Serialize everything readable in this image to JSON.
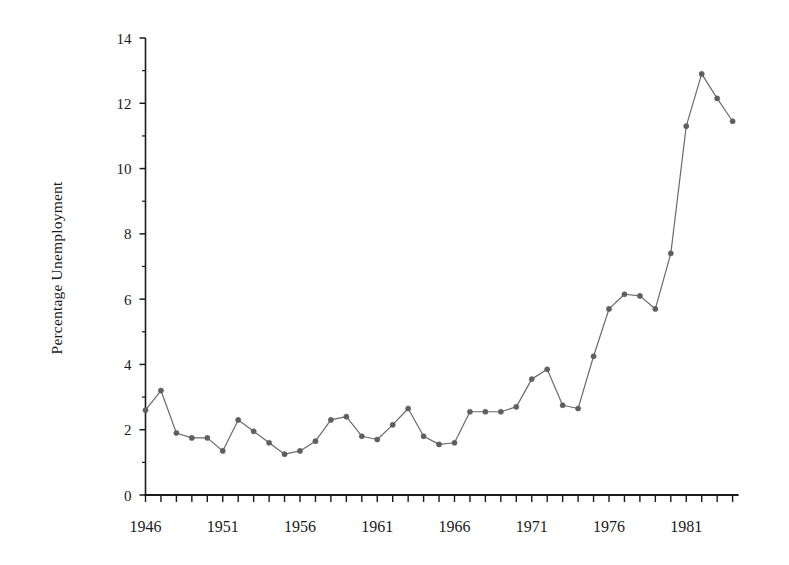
{
  "chart_data": {
    "type": "line",
    "title": "",
    "subtitle": "",
    "xlabel": "",
    "ylabel": "Percentage Unemployment",
    "xlim": [
      1945.5,
      1984.5
    ],
    "ylim": [
      0,
      14
    ],
    "grid": false,
    "legend": null,
    "legend_position": "none",
    "marker": "filled-circle",
    "line_color": "#6b6b6b",
    "marker_color": "#5f5f5f",
    "axis_color": "#1a1a1a",
    "y_ticks": [
      0,
      2,
      4,
      6,
      8,
      10,
      12,
      14
    ],
    "y_tick_labels": [
      "0",
      "2",
      "4",
      "6",
      "8",
      "10",
      "12",
      "14"
    ],
    "y_minor_tick_step": 1,
    "x_ticks_all_years": true,
    "x_tick_labels": [
      "1946",
      "1951",
      "1956",
      "1961",
      "1966",
      "1971",
      "1976",
      "1981"
    ],
    "x_tick_label_years": [
      1946,
      1951,
      1956,
      1961,
      1966,
      1971,
      1976,
      1981
    ],
    "x": [
      1946,
      1947,
      1948,
      1949,
      1950,
      1951,
      1952,
      1953,
      1954,
      1955,
      1956,
      1957,
      1958,
      1959,
      1960,
      1961,
      1962,
      1963,
      1964,
      1965,
      1966,
      1967,
      1968,
      1969,
      1970,
      1971,
      1972,
      1973,
      1974,
      1975,
      1976,
      1977,
      1978,
      1979,
      1980,
      1981,
      1982,
      1983,
      1984
    ],
    "categories": [
      "1946",
      "1947",
      "1948",
      "1949",
      "1950",
      "1951",
      "1952",
      "1953",
      "1954",
      "1955",
      "1956",
      "1957",
      "1958",
      "1959",
      "1960",
      "1961",
      "1962",
      "1963",
      "1964",
      "1965",
      "1966",
      "1967",
      "1968",
      "1969",
      "1970",
      "1971",
      "1972",
      "1973",
      "1974",
      "1975",
      "1976",
      "1977",
      "1978",
      "1979",
      "1980",
      "1981",
      "1982",
      "1983",
      "1984"
    ],
    "values": [
      2.6,
      3.2,
      1.9,
      1.75,
      1.75,
      1.35,
      2.3,
      1.95,
      1.6,
      1.25,
      1.35,
      1.65,
      2.3,
      2.4,
      1.8,
      1.7,
      2.15,
      2.65,
      1.8,
      1.55,
      1.6,
      2.55,
      2.55,
      2.55,
      2.7,
      3.55,
      3.85,
      2.75,
      2.65,
      4.25,
      5.7,
      6.15,
      6.1,
      5.7,
      7.4,
      11.3,
      12.9,
      12.15,
      11.45
    ],
    "series": [
      {
        "name": "Percentage Unemployment",
        "values": [
          2.6,
          3.2,
          1.9,
          1.75,
          1.75,
          1.35,
          2.3,
          1.95,
          1.6,
          1.25,
          1.35,
          1.65,
          2.3,
          2.4,
          1.8,
          1.7,
          2.15,
          2.65,
          1.8,
          1.55,
          1.6,
          2.55,
          2.55,
          2.55,
          2.7,
          3.55,
          3.85,
          2.75,
          2.65,
          4.25,
          5.7,
          6.15,
          6.1,
          5.7,
          7.4,
          11.3,
          12.9,
          12.15,
          11.45
        ]
      }
    ],
    "annotations": []
  }
}
